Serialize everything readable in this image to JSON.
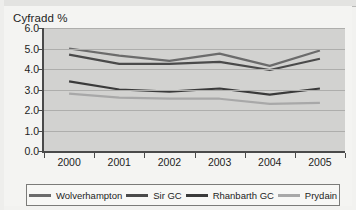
{
  "chart_data": {
    "type": "line",
    "title": "Cyfradd %",
    "xlabel": "",
    "ylabel": "",
    "categories": [
      "2000",
      "2001",
      "2002",
      "2003",
      "2004",
      "2005"
    ],
    "ylim": [
      0.0,
      6.0
    ],
    "ytick_step": 1.0,
    "ytick_labels": [
      "6.0",
      "5.0",
      "4.0",
      "3.0",
      "2.0",
      "1.0",
      "0.0"
    ],
    "ytick_values": [
      6.0,
      5.0,
      4.0,
      3.0,
      2.0,
      1.0,
      0.0
    ],
    "grid": true,
    "legend_position": "bottom",
    "series": [
      {
        "name": "Wolverhampton",
        "color": "#6b6b6b",
        "values": [
          5.0,
          4.65,
          4.4,
          4.75,
          4.15,
          4.9
        ]
      },
      {
        "name": "Sir GC",
        "color": "#4a4a4a",
        "values": [
          4.7,
          4.25,
          4.25,
          4.35,
          3.95,
          4.5
        ]
      },
      {
        "name": "Rhanbarth GC",
        "color": "#3a3a3a",
        "values": [
          3.4,
          3.0,
          2.9,
          3.05,
          2.75,
          3.05
        ]
      },
      {
        "name": "Prydain",
        "color": "#a8a8a8",
        "values": [
          2.8,
          2.6,
          2.55,
          2.55,
          2.3,
          2.35
        ]
      }
    ]
  },
  "colors": {
    "plot_background": "#d2d2d0",
    "page_background": "#f4f4f2",
    "gridline": "#aeaeac",
    "axis": "#4a4a4a",
    "text": "#1d1d1d",
    "legend_border": "#7b7b79",
    "legend_background": "#f7f7f5"
  }
}
